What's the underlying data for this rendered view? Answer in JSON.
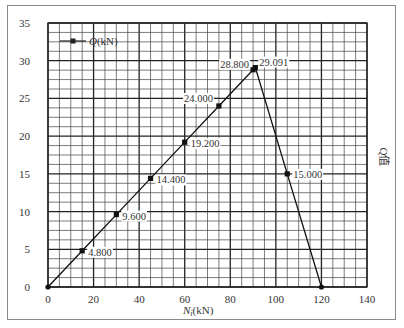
{
  "chart_data": {
    "type": "line",
    "title": "",
    "xlabel": "N_i(kN)",
    "ylabel": "Q值",
    "xlim": [
      0,
      140
    ],
    "ylim": [
      0,
      35
    ],
    "xticks": [
      0,
      20,
      40,
      60,
      80,
      100,
      120,
      140
    ],
    "yticks": [
      0,
      5,
      10,
      15,
      20,
      25,
      30,
      35
    ],
    "grid": true,
    "legend": {
      "position": "upper-left",
      "entries": [
        "Q(kN)"
      ]
    },
    "series": [
      {
        "name": "Q(kN)",
        "x": [
          0,
          15,
          30,
          45,
          60,
          75,
          90,
          91,
          105,
          120
        ],
        "y": [
          0,
          4.8,
          9.6,
          14.4,
          19.2,
          24.0,
          28.8,
          29.091,
          15.0,
          0
        ],
        "labels": [
          "",
          "4.800",
          "9.600",
          "14.400",
          "19.200",
          "24.000",
          "28.800",
          "29.091",
          "15.000",
          ""
        ]
      }
    ]
  },
  "axes": {
    "x_title_main": "N",
    "x_title_sub": "i",
    "x_title_unit": "(kN)",
    "y_title": "Q值",
    "legend_label_italic": "Q",
    "legend_label_unit": "(kN)"
  }
}
